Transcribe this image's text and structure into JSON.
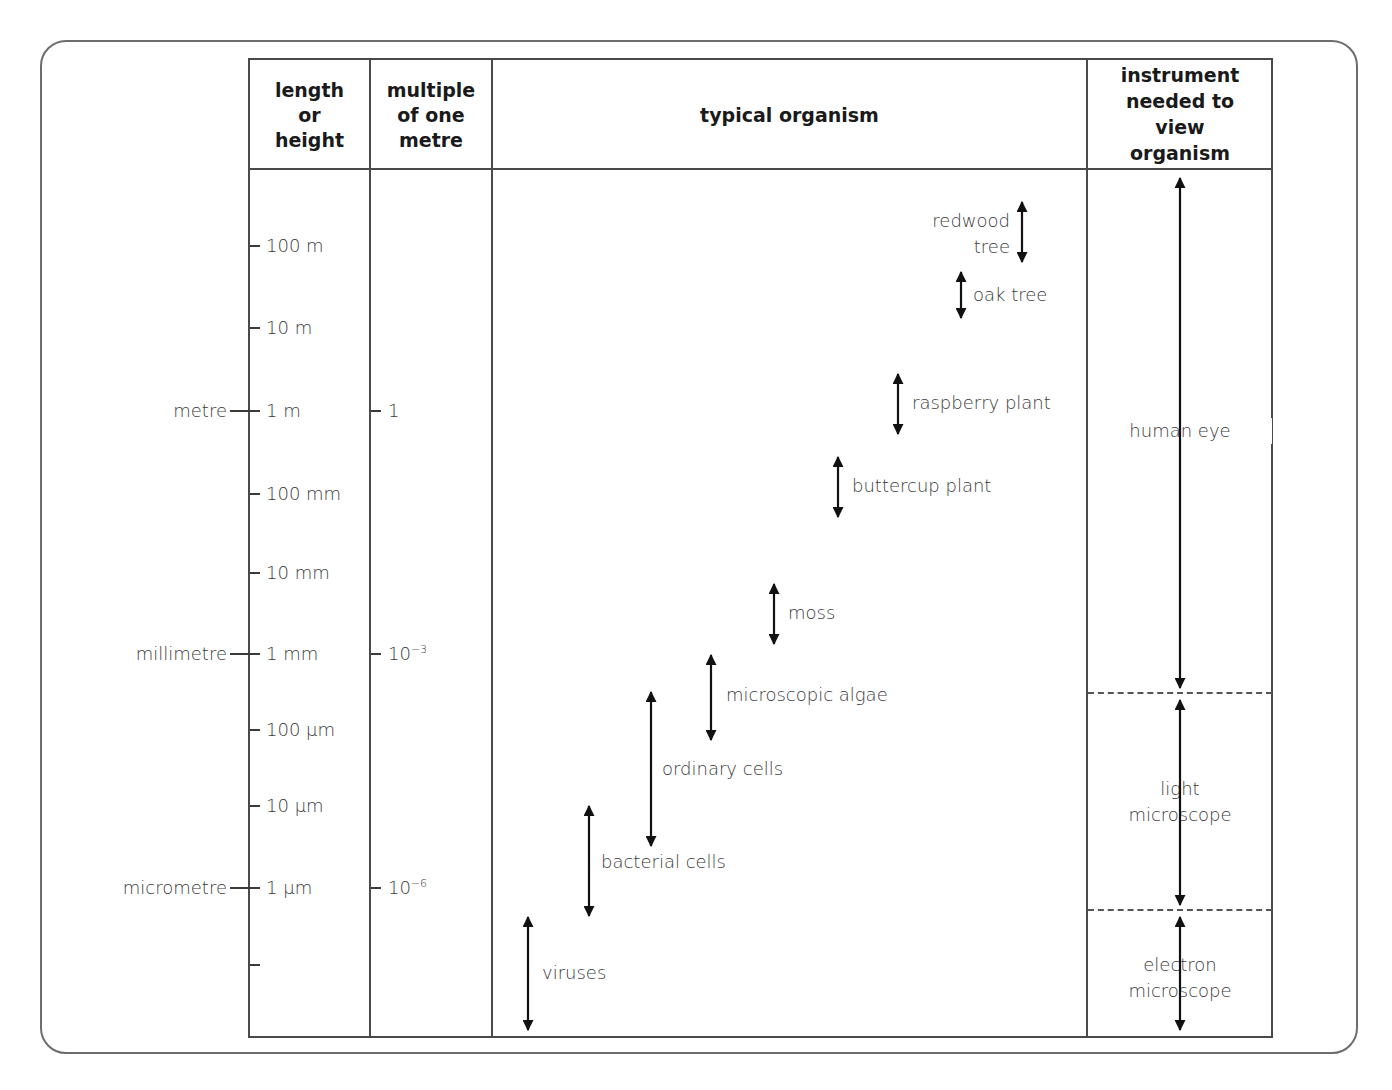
{
  "table": {
    "headers": [
      {
        "label": "length\nor\nheight"
      },
      {
        "label": "multiple\nof one\nmetre"
      },
      {
        "label": "typical organism"
      },
      {
        "label": "instrument\nneeded to\nview\norganism"
      }
    ]
  },
  "scale": {
    "length_ticks": [
      {
        "label": "100 m",
        "y": 246
      },
      {
        "label": "10 m",
        "y": 328
      },
      {
        "label": "1 m",
        "y": 411,
        "unit_name": "metre",
        "multiple": "1"
      },
      {
        "label": "100 mm",
        "y": 494
      },
      {
        "label": "10 mm",
        "y": 573
      },
      {
        "label": "1 mm",
        "y": 654,
        "unit_name": "millimetre",
        "multiple_base": "10",
        "multiple_exp": "−3"
      },
      {
        "label": "100 µm",
        "y": 730
      },
      {
        "label": "10 µm",
        "y": 806
      },
      {
        "label": "1 µm",
        "y": 888,
        "unit_name": "micrometre",
        "multiple_base": "10",
        "multiple_exp": "−6"
      },
      {
        "label": "",
        "y": 965
      }
    ],
    "unit_names": {
      "metre": "metre",
      "millimetre": "millimetre",
      "micrometre": "micrometre"
    },
    "multiples": {
      "one": "1",
      "milli_base": "10",
      "milli_exp": "−3",
      "micro_base": "10",
      "micro_exp": "−6"
    }
  },
  "organisms": [
    {
      "name": "redwood\ntree",
      "x": 1022,
      "y1": 202,
      "y2": 262,
      "label_side": "left"
    },
    {
      "name": "oak tree",
      "x": 961,
      "y1": 272,
      "y2": 318,
      "label_side": "right"
    },
    {
      "name": "raspberry plant",
      "x": 898,
      "y1": 374,
      "y2": 434,
      "label_side": "right"
    },
    {
      "name": "buttercup plant",
      "x": 838,
      "y1": 457,
      "y2": 517,
      "label_side": "right"
    },
    {
      "name": "moss",
      "x": 774,
      "y1": 584,
      "y2": 644,
      "label_side": "right"
    },
    {
      "name": "microscopic algae",
      "x": 711,
      "y1": 655,
      "y2": 740,
      "label_side": "right"
    },
    {
      "name": "ordinary cells",
      "x": 651,
      "y1": 692,
      "y2": 846,
      "label_side": "right"
    },
    {
      "name": "bacterial cells",
      "x": 589,
      "y1": 806,
      "y2": 916,
      "label_side": "right"
    },
    {
      "name": "viruses",
      "x": 528,
      "y1": 917,
      "y2": 1030,
      "label_side": "right"
    }
  ],
  "instruments": [
    {
      "name": "human eye",
      "label_y": 430,
      "arrow_top": 178,
      "arrow_bottom": 688
    },
    {
      "name": "light\nmicroscope",
      "label_y": 802,
      "arrow_top": 700,
      "arrow_bottom": 905
    },
    {
      "name": "electron\nmicroscope",
      "label_y": 978,
      "arrow_top": 917,
      "arrow_bottom": 1030
    }
  ],
  "dividers": [
    693,
    910
  ],
  "colors": {
    "line": "#4a4a4a",
    "text": "#3a3a3a",
    "header_text": "#1a1a1a",
    "arrow": "#111111",
    "frame": "#6d6d6d"
  }
}
